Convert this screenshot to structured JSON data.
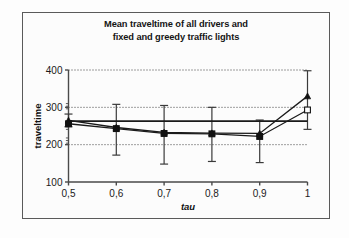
{
  "figure": {
    "background_color": "#fdfdfd",
    "frame_color": "#5a5a5a"
  },
  "title": {
    "line1": "Mean traveltime of all drivers and",
    "line2": "fixed and greedy traffic lights"
  },
  "axes": {
    "x_title": "tau",
    "y_title": "traveltime",
    "x_tick_labels": [
      "0,5",
      "0,6",
      "0,7",
      "0,8",
      "0,9",
      "1"
    ],
    "y_tick_labels": [
      "100",
      "200",
      "300",
      "400"
    ]
  },
  "chart_data": {
    "type": "line",
    "title": "Mean traveltime of all drivers and fixed and greedy traffic lights",
    "xlabel": "tau",
    "ylabel": "traveltime",
    "x": [
      0.5,
      0.6,
      0.7,
      0.8,
      0.9,
      1.0
    ],
    "x_tick_labels": [
      "0,5",
      "0,6",
      "0,7",
      "0,8",
      "0,9",
      "1"
    ],
    "xlim": [
      0.5,
      1.0
    ],
    "ylim": [
      100,
      400
    ],
    "y_ticks": [
      100,
      200,
      300,
      400
    ],
    "grid": "horizontal-dotted",
    "legend": "none",
    "series": [
      {
        "name": "greedy-traffic-lights",
        "marker": "triangle",
        "values": [
          265,
          246,
          233,
          231,
          230,
          330
        ],
        "error_low": [
          248,
          172,
          148,
          155,
          152,
          241
        ],
        "error_high": [
          282,
          308,
          305,
          300,
          266,
          398
        ]
      },
      {
        "name": "fixed-traffic-lights",
        "marker": "square",
        "values": [
          256,
          243,
          230,
          229,
          222,
          293
        ],
        "error_low": [
          248,
          172,
          148,
          155,
          152,
          241
        ],
        "error_high": [
          282,
          308,
          305,
          300,
          266,
          398
        ]
      },
      {
        "name": "reference-constant",
        "marker": "none",
        "values": [
          263,
          263,
          263,
          263,
          263,
          263
        ]
      }
    ]
  }
}
